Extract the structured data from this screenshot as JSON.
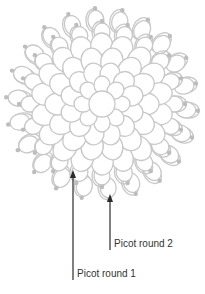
{
  "diagram": {
    "colors": {
      "outline": "#c8c8c8",
      "picot_dot": "#bdbdbd",
      "arrow": "#2a2a2a",
      "text": "#333333"
    },
    "center": {
      "x": 102,
      "y": 104
    },
    "annotations": [
      {
        "label": "Picot round 1",
        "arrow_tip": {
          "x": 73,
          "y": 170
        },
        "line_bottom": {
          "x": 73,
          "y": 280
        },
        "text_pos": {
          "x": 77,
          "y": 268
        }
      },
      {
        "label": "Picot round 2",
        "arrow_tip": {
          "x": 110,
          "y": 194
        },
        "line_bottom": {
          "x": 110,
          "y": 250
        },
        "text_pos": {
          "x": 114,
          "y": 238
        }
      }
    ]
  }
}
